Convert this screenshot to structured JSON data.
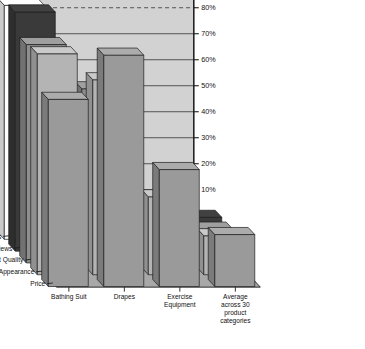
{
  "chart": {
    "type": "3d-bar",
    "title": "",
    "xlabel": "",
    "ylabel": "",
    "zlabel": "",
    "grid": true,
    "legend_position": "none",
    "ylim": [
      0,
      95
    ],
    "y_ticks": [
      "0%",
      "10%",
      "20%",
      "30%",
      "40%",
      "50%",
      "60%",
      "70%",
      "80%",
      "90%"
    ],
    "y_tick_values": [
      0,
      10,
      20,
      30,
      40,
      50,
      60,
      70,
      80,
      90
    ]
  },
  "chart_data": {
    "type": "bar",
    "title": "",
    "xlabel": "",
    "ylabel": "",
    "ylim": [
      0,
      95
    ],
    "grid": true,
    "legend_position": "none",
    "categories": [
      "Bathing Suit",
      "Drapes",
      "Exercise Equipment",
      "Average across 30 product categories"
    ],
    "depth_categories": [
      "Price",
      "Appearance",
      "Product Quality",
      "Reviews",
      "Coupons",
      "Convenience"
    ],
    "series": [
      {
        "name": "Price",
        "values": [
          72,
          89,
          45,
          20
        ]
      },
      {
        "name": "Appearance",
        "values": [
          85,
          75,
          30,
          15
        ]
      },
      {
        "name": "Product Quality",
        "values": [
          84,
          67,
          22,
          13
        ]
      },
      {
        "name": "Reviews",
        "values": [
          92,
          31,
          16,
          13
        ]
      },
      {
        "name": "Coupons",
        "values": [
          90,
          2,
          1,
          5
        ]
      },
      {
        "name": "Convenience",
        "values": [
          18,
          1,
          1,
          1
        ]
      }
    ],
    "series_colors": [
      "#9a9a9a",
      "#b4b4b4",
      "#8e8e8e",
      "#3a3a3a",
      "#fdfdfd",
      "#e8e8e8"
    ]
  },
  "labels": {
    "x_categories": [
      {
        "text": "Bathing Suit"
      },
      {
        "text": "Drapes"
      },
      {
        "text_line1": "Exercise",
        "text_line2": "Equipment"
      },
      {
        "text_line1": "Average",
        "text_line2": "across 30",
        "text_line3": "product",
        "text_line4": "categories"
      }
    ],
    "z_categories": [
      "Price",
      "Appearance",
      "Product Quality",
      "Reviews",
      "Coupons",
      "Convenience"
    ],
    "y_ticks": [
      "90%",
      "80%",
      "70%",
      "60%",
      "50%",
      "40%",
      "30%",
      "20%",
      "10%",
      "0%"
    ]
  },
  "colors": {
    "back_wall": "#d2d2d2",
    "side_wall": "#c4c4c4",
    "floor": "#a8a8a8",
    "outline": "#1c1c1c",
    "grid_line": "#2a2a2a"
  }
}
